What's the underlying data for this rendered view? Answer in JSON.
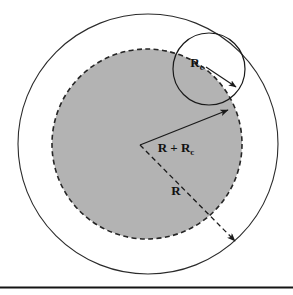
{
  "figure": {
    "background_color": "#ffffff",
    "shaded_fill_color": "#b3b3b3",
    "stroke_color": "#1a1a1a",
    "footer_rule_color": "#141414",
    "labels": {
      "small_circle_radius": {
        "base": "R",
        "subscript": "c"
      },
      "outer_radius_sum": {
        "base": "R + R",
        "subscript": "c"
      },
      "inner_radius": {
        "base": "R",
        "subscript": ""
      }
    },
    "shapes": [
      {
        "name": "outer-circle",
        "type": "circle",
        "cx": 148,
        "cy": 144,
        "r": 130,
        "stroke": "#1a1a1a",
        "fill": "none",
        "dashed": false
      },
      {
        "name": "shaded-inner-circle",
        "type": "circle",
        "cx": 147,
        "cy": 144,
        "r": 95,
        "stroke": "#1a1a1a",
        "fill": "#b3b3b3",
        "dashed": true
      },
      {
        "name": "tangent-circle",
        "type": "circle",
        "cx": 209,
        "cy": 69,
        "r": 36,
        "stroke": "#1a1a1a",
        "fill": "none",
        "dashed": false
      }
    ],
    "arrows": [
      {
        "name": "rc-arrow",
        "from": [
          209,
          69
        ],
        "to": [
          238,
          88
        ],
        "dashed": false
      },
      {
        "name": "r-plus-rc-arrow",
        "from": [
          140,
          145
        ],
        "to": [
          230,
          110
        ],
        "dashed": false
      },
      {
        "name": "r-arrow",
        "from": [
          140,
          145
        ],
        "to": [
          237,
          243
        ],
        "dashed": true
      }
    ]
  },
  "footer": {
    "rule_visible": true,
    "rule_y": 287
  }
}
